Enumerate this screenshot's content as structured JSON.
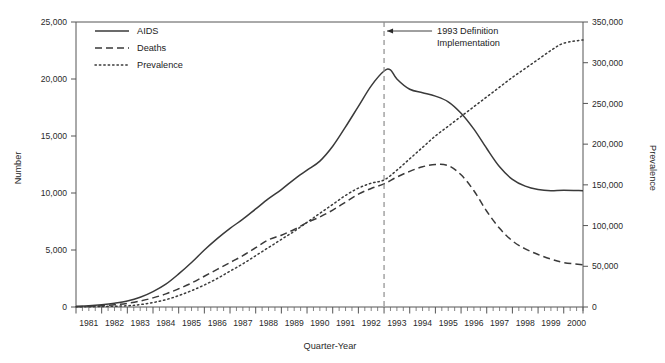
{
  "chart_data": {
    "type": "line",
    "title": "",
    "xlabel": "Quarter-Year",
    "ylabel": "Number",
    "y2label": "Prevalence",
    "ylim": [
      0,
      25000
    ],
    "y2lim": [
      0,
      350000
    ],
    "xlim": [
      1981,
      2000.75
    ],
    "grid": false,
    "legend_position": "top-left",
    "categories": [
      "1981",
      "1982",
      "1983",
      "1984",
      "1985",
      "1986",
      "1987",
      "1988",
      "1989",
      "1990",
      "1991",
      "1992",
      "1993",
      "1994",
      "1995",
      "1996",
      "1997",
      "1998",
      "1999",
      "2000"
    ],
    "ytick_labels": [
      "0",
      "5,000",
      "10,000",
      "15,000",
      "20,000",
      "25,000"
    ],
    "ytick_values": [
      0,
      5000,
      10000,
      15000,
      20000,
      25000
    ],
    "y2tick_labels": [
      "0",
      "50,000",
      "100,000",
      "150,000",
      "200,000",
      "250,000",
      "300,000",
      "350,000"
    ],
    "y2tick_values": [
      0,
      50000,
      100000,
      150000,
      200000,
      250000,
      300000,
      350000
    ],
    "minor_ticks_per_year": 4,
    "annotations": [
      {
        "name": "definition-change",
        "text_line1": "1993 Definition",
        "text_line2": "Implementation",
        "x": 1993.0,
        "style": "dashed-vertical-with-arrow"
      }
    ],
    "series": [
      {
        "name": "AIDS",
        "axis": "left",
        "style": "solid",
        "color": "#3a3a3a",
        "x": [
          1981.0,
          1981.5,
          1982.0,
          1982.5,
          1983.0,
          1983.5,
          1984.0,
          1984.5,
          1985.0,
          1985.5,
          1986.0,
          1986.5,
          1987.0,
          1987.5,
          1988.0,
          1988.5,
          1989.0,
          1989.5,
          1990.0,
          1990.5,
          1991.0,
          1991.5,
          1992.0,
          1992.5,
          1993.0,
          1993.25,
          1993.5,
          1994.0,
          1994.5,
          1995.0,
          1995.5,
          1996.0,
          1996.5,
          1997.0,
          1997.5,
          1998.0,
          1998.5,
          1999.0,
          1999.5,
          2000.0,
          2000.75
        ],
        "values": [
          60,
          110,
          200,
          330,
          520,
          850,
          1350,
          2000,
          2900,
          3900,
          5000,
          6000,
          6900,
          7700,
          8600,
          9500,
          10300,
          11200,
          12000,
          12800,
          14100,
          15800,
          17600,
          19400,
          20700,
          20800,
          20000,
          19100,
          18800,
          18500,
          18000,
          17000,
          15600,
          13900,
          12300,
          11200,
          10600,
          10300,
          10200,
          10250,
          10200
        ]
      },
      {
        "name": "Deaths",
        "axis": "left",
        "style": "dashed",
        "color": "#3a3a3a",
        "x": [
          1981.0,
          1981.5,
          1982.0,
          1982.5,
          1983.0,
          1983.5,
          1984.0,
          1984.5,
          1985.0,
          1985.5,
          1986.0,
          1986.5,
          1987.0,
          1987.5,
          1988.0,
          1988.5,
          1989.0,
          1989.5,
          1990.0,
          1990.5,
          1991.0,
          1991.5,
          1992.0,
          1992.5,
          1993.0,
          1993.5,
          1994.0,
          1994.5,
          1995.0,
          1995.5,
          1996.0,
          1996.5,
          1997.0,
          1997.5,
          1998.0,
          1998.5,
          1999.0,
          1999.5,
          2000.0,
          2000.75
        ],
        "values": [
          30,
          60,
          110,
          190,
          320,
          520,
          800,
          1150,
          1600,
          2100,
          2700,
          3300,
          3900,
          4500,
          5200,
          5900,
          6300,
          6800,
          7400,
          7900,
          8500,
          9200,
          9900,
          10400,
          10800,
          11400,
          11900,
          12300,
          12500,
          12400,
          11600,
          10200,
          8400,
          6900,
          5800,
          5100,
          4600,
          4200,
          3900,
          3700
        ]
      },
      {
        "name": "Prevalence",
        "axis": "right",
        "style": "dotted",
        "color": "#3a3a3a",
        "x": [
          1981.0,
          1982.0,
          1983.0,
          1983.5,
          1984.0,
          1984.5,
          1985.0,
          1985.5,
          1986.0,
          1986.5,
          1987.0,
          1987.5,
          1988.0,
          1988.5,
          1989.0,
          1989.5,
          1990.0,
          1990.5,
          1991.0,
          1991.5,
          1992.0,
          1992.5,
          1993.0,
          1993.5,
          1994.0,
          1994.5,
          1995.0,
          1995.5,
          1996.0,
          1996.5,
          1997.0,
          1997.5,
          1998.0,
          1998.5,
          1999.0,
          1999.5,
          2000.0,
          2000.75
        ],
        "values": [
          200,
          600,
          1500,
          3000,
          5500,
          9000,
          14000,
          20000,
          27000,
          35000,
          44000,
          53000,
          63000,
          73000,
          83000,
          93000,
          104000,
          115000,
          126000,
          137000,
          146000,
          152000,
          156000,
          168000,
          182000,
          196000,
          210000,
          222000,
          234000,
          246000,
          258000,
          270000,
          282000,
          293000,
          304000,
          315000,
          324000,
          328000
        ]
      }
    ]
  },
  "legend": {
    "items": [
      {
        "label": "AIDS",
        "style": "solid"
      },
      {
        "label": "Deaths",
        "style": "dashed"
      },
      {
        "label": "Prevalence",
        "style": "dotted"
      }
    ]
  },
  "axes": {
    "left_title": "Number",
    "right_title": "Prevalence",
    "bottom_title": "Quarter-Year"
  }
}
